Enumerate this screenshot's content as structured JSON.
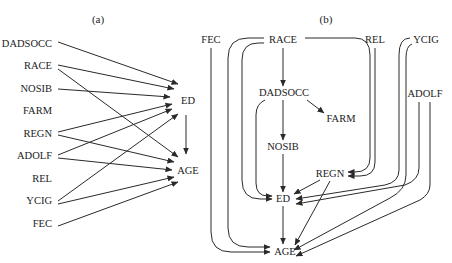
{
  "panel_a": {
    "title": "(a)",
    "nodes": {
      "DADSOCC": "DADSOCC",
      "RACE": "RACE",
      "NOSIB": "NOSIB",
      "FARM": "FARM",
      "REGN": "REGN",
      "ADOLF": "ADOLF",
      "REL": "REL",
      "YCIG": "YCIG",
      "FEC": "FEC",
      "ED": "ED",
      "AGE": "AGE"
    },
    "edges": [
      [
        "DADSOCC",
        "ED"
      ],
      [
        "RACE",
        "ED"
      ],
      [
        "RACE",
        "AGE"
      ],
      [
        "NOSIB",
        "ED"
      ],
      [
        "REGN",
        "ED"
      ],
      [
        "REGN",
        "AGE"
      ],
      [
        "ADOLF",
        "ED"
      ],
      [
        "ADOLF",
        "AGE"
      ],
      [
        "YCIG",
        "ED"
      ],
      [
        "YCIG",
        "AGE"
      ],
      [
        "FEC",
        "AGE"
      ],
      [
        "ED",
        "AGE"
      ]
    ]
  },
  "panel_b": {
    "title": "(b)",
    "nodes": {
      "FEC": "FEC",
      "RACE": "RACE",
      "REL": "REL",
      "YCIG": "YCIG",
      "DADSOCC": "DADSOCC",
      "FARM": "FARM",
      "ADOLF": "ADOLF",
      "NOSIB": "NOSIB",
      "REGN": "REGN",
      "ED": "ED",
      "AGE": "AGE"
    },
    "edges": [
      [
        "FEC",
        "AGE"
      ],
      [
        "RACE",
        "DADSOCC"
      ],
      [
        "RACE",
        "AGE"
      ],
      [
        "RACE",
        "ED"
      ],
      [
        "RACE",
        "REGN"
      ],
      [
        "DADSOCC",
        "FARM"
      ],
      [
        "DADSOCC",
        "NOSIB"
      ],
      [
        "DADSOCC",
        "ED"
      ],
      [
        "NOSIB",
        "ED"
      ],
      [
        "REL",
        "REGN"
      ],
      [
        "YCIG",
        "REGN"
      ],
      [
        "YCIG",
        "ED"
      ],
      [
        "ADOLF",
        "ED"
      ],
      [
        "ADOLF",
        "AGE"
      ],
      [
        "REGN",
        "ED"
      ],
      [
        "REGN",
        "AGE"
      ],
      [
        "ED",
        "AGE"
      ]
    ]
  }
}
